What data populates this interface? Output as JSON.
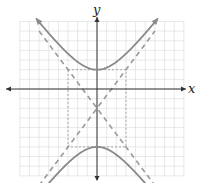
{
  "figure": {
    "type": "hyperbola-graph",
    "x_axis_label": "x",
    "y_axis_label": "y"
  },
  "chart_data": {
    "type": "line",
    "title": "",
    "xlabel": "x",
    "ylabel": "y",
    "xlim": [
      -8,
      9
    ],
    "ylim": [
      -9,
      7
    ],
    "grid": true,
    "grid_step": 1,
    "center": [
      0,
      -2
    ],
    "a": 4,
    "b": 3,
    "orientation": "vertical",
    "equation": "(y+2)^2/16 - x^2/9 = 1",
    "vertices": [
      [
        0,
        2
      ],
      [
        0,
        -6
      ]
    ],
    "fundamental_rectangle": {
      "x": [
        -3,
        3
      ],
      "y": [
        -6,
        2
      ]
    },
    "asymptotes": [
      "y = (4/3)x - 2",
      "y = -(4/3)x - 2"
    ],
    "series": [
      {
        "name": "upper branch",
        "style": "solid"
      },
      {
        "name": "lower branch",
        "style": "solid"
      },
      {
        "name": "asymptotes",
        "style": "dashed"
      },
      {
        "name": "fundamental rectangle",
        "style": "dotted"
      }
    ]
  },
  "colors": {
    "grid": "#d9d9d9",
    "axis": "#333333",
    "curve": "#8a8a8a",
    "asymptote": "#9a9a9a",
    "rectangle": "#a5a5a5"
  }
}
